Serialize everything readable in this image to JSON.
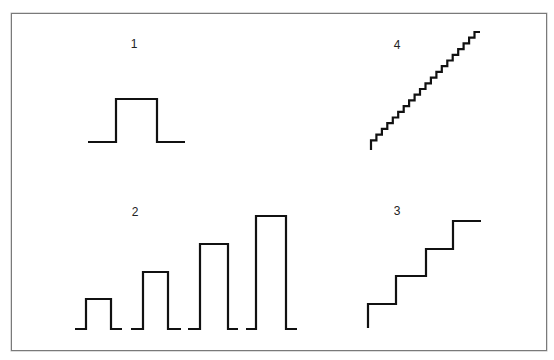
{
  "diagram": {
    "panels": [
      {
        "id": "1",
        "label": "1",
        "label_pos": [
          134,
          44
        ],
        "description": "single rectangular pulse",
        "path": [
          [
            88,
            142
          ],
          [
            116,
            142
          ],
          [
            116,
            99
          ],
          [
            157,
            99
          ],
          [
            157,
            142
          ],
          [
            185,
            142
          ]
        ]
      },
      {
        "id": "2",
        "label": "2",
        "label_pos": [
          135,
          212
        ],
        "description": "four pulses of increasing amplitude",
        "pulses": [
          {
            "path": [
              [
                75,
                329
              ],
              [
                86,
                329
              ],
              [
                86,
                299
              ],
              [
                111,
                299
              ],
              [
                111,
                329
              ],
              [
                122,
                329
              ]
            ]
          },
          {
            "path": [
              [
                131,
                329
              ],
              [
                143,
                329
              ],
              [
                143,
                272
              ],
              [
                168,
                272
              ],
              [
                168,
                329
              ],
              [
                181,
                329
              ]
            ]
          },
          {
            "path": [
              [
                188,
                329
              ],
              [
                200,
                329
              ],
              [
                200,
                244
              ],
              [
                228,
                244
              ],
              [
                228,
                329
              ],
              [
                238,
                329
              ]
            ]
          },
          {
            "path": [
              [
                246,
                329
              ],
              [
                256,
                329
              ],
              [
                256,
                216
              ],
              [
                286,
                216
              ],
              [
                286,
                329
              ],
              [
                297,
                329
              ]
            ]
          }
        ]
      },
      {
        "id": "3",
        "label": "3",
        "label_pos": [
          397,
          211
        ],
        "description": "coarse staircase (4 steps)",
        "path": [
          [
            368,
            328
          ],
          [
            368,
            304
          ],
          [
            396,
            304
          ],
          [
            396,
            276
          ],
          [
            426,
            276
          ],
          [
            426,
            249
          ],
          [
            453,
            249
          ],
          [
            453,
            221
          ],
          [
            481,
            221
          ]
        ]
      },
      {
        "id": "4",
        "label": "4",
        "label_pos": [
          397,
          45
        ],
        "description": "fine staircase (~20 steps)",
        "start": [
          371,
          146
        ],
        "end": [
          480,
          32
        ],
        "steps": 20
      }
    ],
    "colors": {
      "stroke": "#111111",
      "frame": "#7a7a7a",
      "background": "#ffffff"
    }
  }
}
